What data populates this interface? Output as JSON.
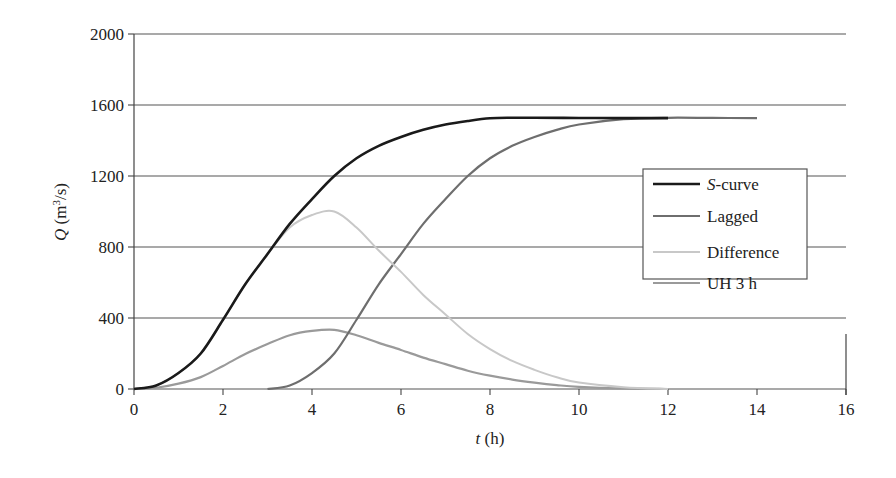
{
  "chart_data": {
    "type": "line",
    "title": "",
    "xlabel": "t (h)",
    "xlabel_var": "t",
    "xlabel_unit": " (h)",
    "ylabel": "Q (m3/s)",
    "ylabel_var": "Q",
    "ylabel_unit": " (m",
    "ylabel_sup": "3",
    "ylabel_tail": "/s)",
    "xlim": [
      0,
      16
    ],
    "ylim": [
      0,
      2000
    ],
    "xticks": [
      0,
      2,
      4,
      6,
      8,
      10,
      12,
      14,
      16
    ],
    "yticks": [
      0,
      400,
      800,
      1200,
      1600,
      2000
    ],
    "grid": "horizontal",
    "legend_position": "right-center",
    "series": [
      {
        "name": "S-curve",
        "name_italic": "S",
        "name_rest": "-curve",
        "color": "#1a1a1a",
        "width": 2.6,
        "x": [
          0,
          0.5,
          1,
          1.5,
          2,
          2.5,
          3,
          3.5,
          4,
          4.5,
          5,
          5.5,
          6,
          6.5,
          7,
          7.5,
          8,
          8.5,
          9,
          10,
          11,
          12
        ],
        "y": [
          0,
          20,
          90,
          200,
          390,
          590,
          760,
          930,
          1070,
          1200,
          1300,
          1370,
          1420,
          1460,
          1490,
          1510,
          1525,
          1528,
          1528,
          1527,
          1526,
          1526
        ]
      },
      {
        "name": "Lagged",
        "color": "#6e6e6e",
        "width": 2.2,
        "x": [
          3,
          3.5,
          4,
          4.5,
          5,
          5.5,
          6,
          6.5,
          7,
          7.5,
          8,
          8.5,
          9,
          9.5,
          10,
          11,
          12,
          13,
          14
        ],
        "y": [
          0,
          20,
          90,
          200,
          390,
          590,
          760,
          930,
          1070,
          1200,
          1300,
          1370,
          1420,
          1460,
          1490,
          1520,
          1528,
          1527,
          1526
        ]
      },
      {
        "name": "Difference",
        "color": "#c8c8c8",
        "width": 2.0,
        "x": [
          0,
          0.5,
          1,
          1.5,
          2,
          2.5,
          3,
          3.5,
          4,
          4.5,
          5,
          5.5,
          6,
          6.5,
          7,
          7.5,
          8,
          8.5,
          9,
          9.5,
          10,
          11,
          12
        ],
        "y": [
          0,
          20,
          90,
          200,
          390,
          590,
          760,
          910,
          980,
          1000,
          910,
          780,
          660,
          530,
          420,
          310,
          225,
          158,
          108,
          66,
          36,
          10,
          0
        ]
      },
      {
        "name": "UH 3 h",
        "color": "#9a9a9a",
        "width": 2.2,
        "x": [
          0,
          0.5,
          1,
          1.5,
          2,
          2.5,
          3,
          3.5,
          4,
          4.5,
          5,
          5.5,
          6,
          6.5,
          7,
          7.5,
          8,
          8.5,
          9,
          9.5,
          10,
          11,
          12
        ],
        "y": [
          0,
          7,
          30,
          67,
          130,
          197,
          253,
          303,
          327,
          333,
          303,
          260,
          220,
          177,
          140,
          103,
          75,
          53,
          36,
          22,
          12,
          3,
          0
        ]
      }
    ]
  }
}
